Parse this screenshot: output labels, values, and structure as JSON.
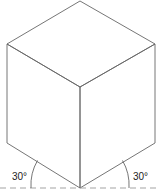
{
  "diagram": {
    "angle_labels": {
      "left": "30°",
      "right": "30°"
    },
    "line_color": "#555555",
    "baseline_color": "#888888"
  }
}
